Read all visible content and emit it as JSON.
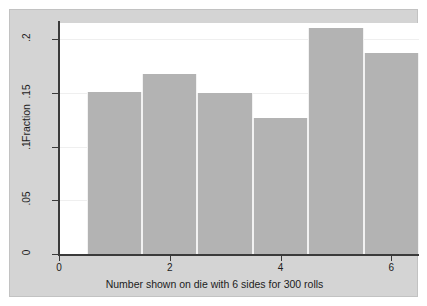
{
  "figure": {
    "background_color": "#d4d4d4",
    "plot_background_color": "#ffffff",
    "bar_color": "#b3b3b3",
    "axis_color": "#3a3a3a",
    "gridline_color": "#efefef"
  },
  "chart_data": {
    "type": "bar",
    "title": "",
    "xlabel": "Number shown on die with 6 sides for 300 rolls",
    "ylabel": "Fraction",
    "categories": [
      "1",
      "2",
      "3",
      "4",
      "5",
      "6"
    ],
    "values": [
      0.151,
      0.168,
      0.15,
      0.127,
      0.21,
      0.187
    ],
    "x": [
      1,
      2,
      3,
      4,
      5,
      6
    ],
    "bar_width": 1,
    "xlim": [
      0,
      6.5
    ],
    "ylim": [
      0,
      0.215
    ],
    "xticks": [
      0,
      2,
      4,
      6
    ],
    "xtick_labels": [
      "0",
      "2",
      "4",
      "6"
    ],
    "yticks": [
      0,
      0.05,
      0.1,
      0.15,
      0.2
    ],
    "ytick_labels": [
      "0",
      ".05",
      ".1",
      ".15",
      ".2"
    ],
    "grid": "horizontal",
    "legend": null
  }
}
